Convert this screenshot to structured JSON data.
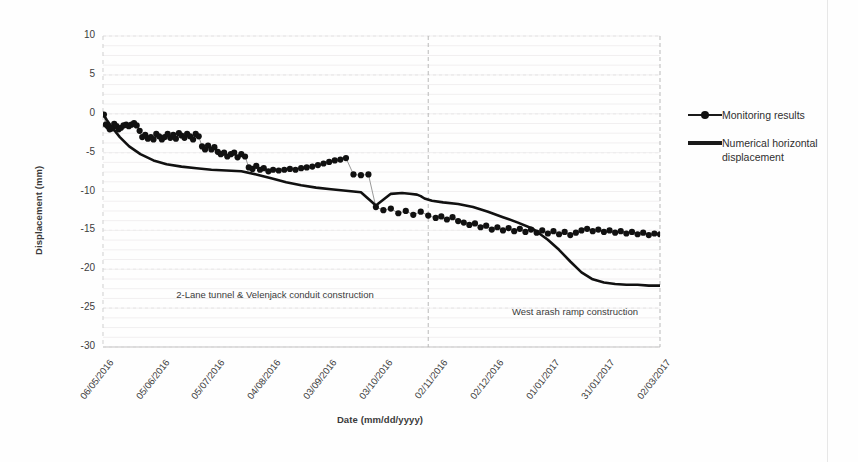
{
  "chart_data": {
    "type": "line",
    "title": "",
    "xlabel": "Date (mm/dd/yyyy)",
    "ylabel": "Displacement (mm)",
    "ylim": [
      -30,
      10
    ],
    "ytick_values": [
      10,
      5,
      0,
      -5,
      -10,
      -15,
      -20,
      -25,
      -30
    ],
    "ytick_labels": [
      "10",
      "5",
      "0",
      "-5",
      "-10",
      "-15",
      "-20",
      "-25",
      "-30"
    ],
    "xtick_labels": [
      "06/05/2016",
      "05/06/2016",
      "05/07/2016",
      "04/08/2016",
      "03/09/2016",
      "03/10/2016",
      "02/11/2016",
      "02/12/2016",
      "01/01/2017",
      "31/01/2017",
      "02/03/2017"
    ],
    "grid": true,
    "legend_position": "right",
    "series": [
      {
        "name": "Monitoring results",
        "style": "markers-with-thin-line",
        "color": "#111111",
        "x": [
          0.5,
          1.5,
          2.6,
          3.6,
          4.8,
          6.0,
          7.2,
          8.4,
          9.6,
          11.0,
          12.4,
          13.8,
          15.2,
          16.6,
          18.0,
          19.6,
          21.0,
          22.6,
          24.0,
          25.6,
          27.0,
          28.5,
          30.0,
          31.5,
          33.0,
          34.6,
          36.0,
          37.6,
          39.0,
          40.6,
          42.0,
          43.6,
          45.0,
          46.6,
          48.2,
          49.6,
          51.2,
          53.0,
          54.6,
          56.2,
          58.0,
          59.6,
          61.4,
          63.0,
          64.8,
          66.5,
          68.4,
          70.2,
          72.0,
          74.0,
          76.0,
          78.0,
          80.0,
          82.0,
          84.0,
          86.0,
          88.5,
          91.0,
          94.0,
          97.0,
          100.0,
          103.0,
          106.0,
          109.0,
          112.0,
          115.0,
          118.0,
          121.0,
          124.0,
          127.0,
          130.0,
          134.0,
          138.0,
          142.0,
          146.0,
          150.0,
          154.0,
          158.0,
          162.0,
          166.0,
          170.0,
          174.0,
          178.0,
          181.0,
          184.0,
          187.0,
          190.0,
          193.0,
          196.0,
          199.0,
          202.0,
          205.0,
          208.0,
          211.0,
          214.0,
          217.0,
          220.0,
          223.0,
          226.0,
          229.0,
          232.0,
          235.0,
          238.0,
          241.0,
          244.0,
          247.0,
          250.0,
          253.0,
          256.0,
          259.0,
          262.0,
          265.0,
          268.0,
          271.0,
          274.0,
          277.0,
          280.0,
          283.0,
          286.0,
          289.0,
          292.0,
          295.0,
          298.0
        ],
        "y": [
          -0.1,
          -1.4,
          -1.6,
          -2.0,
          -1.9,
          -1.3,
          -1.6,
          -2.0,
          -1.8,
          -1.5,
          -1.4,
          -1.6,
          -1.4,
          -1.2,
          -1.5,
          -2.2,
          -3.0,
          -2.7,
          -3.2,
          -3.0,
          -3.3,
          -2.6,
          -2.9,
          -3.3,
          -3.0,
          -2.6,
          -3.1,
          -2.7,
          -3.2,
          -2.5,
          -2.8,
          -3.1,
          -2.6,
          -2.9,
          -3.3,
          -2.6,
          -2.9,
          -4.2,
          -4.6,
          -4.1,
          -4.6,
          -4.3,
          -4.9,
          -5.2,
          -5.0,
          -5.5,
          -5.2,
          -5.0,
          -5.6,
          -5.2,
          -5.5,
          -6.9,
          -7.1,
          -6.7,
          -7.2,
          -7.0,
          -7.4,
          -7.2,
          -7.3,
          -7.2,
          -7.1,
          -7.2,
          -7.0,
          -6.9,
          -6.8,
          -6.6,
          -6.4,
          -6.2,
          -6.0,
          -5.9,
          -5.7,
          -7.8,
          -7.9,
          -7.8,
          -12.0,
          -12.4,
          -12.2,
          -12.8,
          -12.5,
          -13.0,
          -12.6,
          -13.1,
          -13.4,
          -13.2,
          -13.6,
          -13.3,
          -13.8,
          -14.0,
          -14.3,
          -14.1,
          -14.6,
          -14.4,
          -14.9,
          -14.6,
          -15.0,
          -14.7,
          -15.1,
          -14.8,
          -15.2,
          -14.9,
          -15.3,
          -15.0,
          -15.4,
          -15.1,
          -15.5,
          -15.2,
          -15.6,
          -15.3,
          -15.0,
          -14.8,
          -15.1,
          -14.9,
          -15.2,
          -15.0,
          -15.3,
          -15.1,
          -15.4,
          -15.2,
          -15.5,
          -15.3,
          -15.6,
          -15.4,
          -15.5
        ]
      },
      {
        "name": "Numerical horizontal displacement",
        "style": "thick-line",
        "color": "#111111",
        "x": [
          0,
          2,
          5,
          9,
          14,
          20,
          27,
          34,
          42,
          50,
          58,
          66,
          74,
          82,
          90,
          98,
          106,
          114,
          122,
          130,
          138,
          146,
          154,
          160,
          164,
          168,
          170,
          172,
          176,
          182,
          190,
          198,
          206,
          214,
          222,
          230,
          238,
          244,
          250,
          256,
          262,
          268,
          274,
          280,
          286,
          292,
          298
        ],
        "y": [
          0.0,
          -0.8,
          -1.8,
          -3.0,
          -4.2,
          -5.2,
          -6.0,
          -6.5,
          -6.8,
          -7.0,
          -7.2,
          -7.3,
          -7.4,
          -7.8,
          -8.3,
          -8.8,
          -9.2,
          -9.5,
          -9.7,
          -9.9,
          -10.1,
          -11.8,
          -10.3,
          -10.2,
          -10.3,
          -10.4,
          -10.6,
          -10.9,
          -11.2,
          -11.4,
          -11.6,
          -12.0,
          -12.6,
          -13.3,
          -14.0,
          -14.8,
          -16.2,
          -17.5,
          -19.0,
          -20.4,
          -21.3,
          -21.7,
          -21.9,
          -22.0,
          -22.0,
          -22.1,
          -22.1
        ]
      }
    ],
    "annotations": [
      {
        "name": "left-phase",
        "text": "2-Lane tunnel & Velenjack conduit construction"
      },
      {
        "name": "right-phase",
        "text": "West arash ramp construction"
      }
    ],
    "phase_dividers": [
      {
        "x": 174
      },
      {
        "x": 298
      }
    ]
  },
  "legend": {
    "entries": [
      {
        "label": "Monitoring results",
        "key": "marker-line"
      },
      {
        "label": "Numerical horizontal displacement",
        "key": "thick-line"
      }
    ]
  }
}
